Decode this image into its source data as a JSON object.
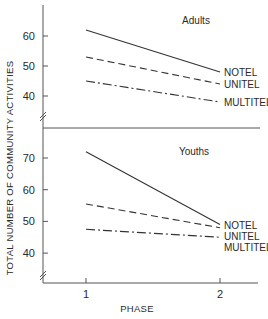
{
  "chart_data": {
    "type": "line",
    "ylabel": "TOTAL NUMBER OF COMMUNITY ACTIVITIES",
    "xlabel": "PHASE",
    "x": [
      1,
      2
    ],
    "x_tick_labels": [
      "1",
      "2"
    ],
    "panels": [
      {
        "title": "Adults",
        "ylim": [
          30,
          68
        ],
        "y_ticks": [
          40,
          50,
          60
        ],
        "series": [
          {
            "name": "NOTEL",
            "style": "solid",
            "values": [
              62,
              48
            ]
          },
          {
            "name": "UNITEL",
            "style": "dashed",
            "values": [
              53,
              44
            ]
          },
          {
            "name": "MULTITEL",
            "style": "dash-dot",
            "values": [
              45,
              38
            ]
          }
        ]
      },
      {
        "title": "Youths",
        "ylim": [
          30,
          75
        ],
        "y_ticks": [
          40,
          50,
          60,
          70
        ],
        "series": [
          {
            "name": "NOTEL",
            "style": "solid",
            "values": [
              72,
              49
            ]
          },
          {
            "name": "UNITEL",
            "style": "dashed",
            "values": [
              55.5,
              48
            ]
          },
          {
            "name": "MULTITEL",
            "style": "dash-dot",
            "values": [
              47.5,
              45
            ]
          }
        ]
      }
    ]
  }
}
